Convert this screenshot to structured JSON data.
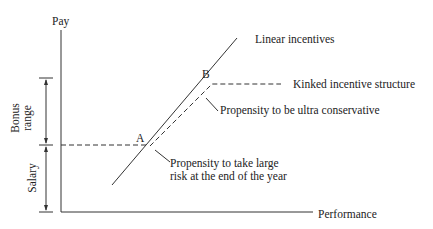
{
  "axes": {
    "y_label": "Pay",
    "x_label": "Performance"
  },
  "brackets": {
    "bonus_range": "Bonus range",
    "bonus_line1": "Bonus",
    "bonus_line2": "range",
    "salary": "Salary"
  },
  "points": {
    "a": "A",
    "b": "B"
  },
  "annotations": {
    "linear": "Linear incentives",
    "kinked": "Kinked incentive structure",
    "conservative": "Propensity to be ultra conservative",
    "risk_line1": "Propensity to take large",
    "risk_line2": "risk at the end of the year"
  },
  "colors": {
    "line": "#333333",
    "background": "#ffffff"
  }
}
